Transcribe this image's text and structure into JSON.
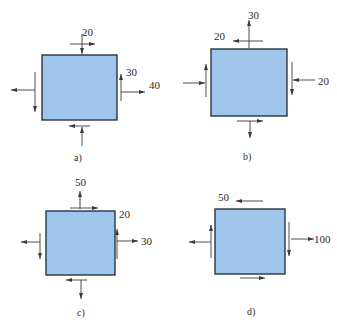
{
  "figure": {
    "fill_color": "#9fc6ea",
    "border_color": "#2b3440",
    "arrow_color": "#3a3a3a",
    "panels": [
      {
        "id": "a",
        "caption": "a)",
        "labels": [
          "20",
          "30",
          "40"
        ],
        "stresses": {
          "top": {
            "normal": "compressive",
            "shear": "right",
            "value_label": "20"
          },
          "right": {
            "normal": "tensile",
            "shear": "up",
            "normal_value": "40",
            "shear_value": "30"
          },
          "bottom": {
            "normal": "compressive",
            "shear": "left"
          },
          "left": {
            "normal": "tensile",
            "shear": "down"
          }
        }
      },
      {
        "id": "b",
        "caption": "b)",
        "labels": [
          "30",
          "20",
          "20"
        ],
        "stresses": {
          "top": {
            "normal": "tensile",
            "shear": "left",
            "normal_value": "30",
            "shear_value": "20"
          },
          "right": {
            "normal": "compressive",
            "shear": "down",
            "normal_value": "20"
          },
          "bottom": {
            "normal": "tensile",
            "shear": "right"
          },
          "left": {
            "normal": "compressive",
            "shear": "up"
          }
        }
      },
      {
        "id": "c",
        "caption": "c)",
        "labels": [
          "50",
          "20",
          "30"
        ],
        "stresses": {
          "top": {
            "normal": "tensile",
            "shear": "right",
            "normal_value": "50",
            "shear_value": "20"
          },
          "right": {
            "normal": "tensile",
            "shear": "up",
            "normal_value": "30"
          },
          "bottom": {
            "normal": "tensile",
            "shear": "left"
          },
          "left": {
            "normal": "tensile",
            "shear": "down"
          }
        }
      },
      {
        "id": "d",
        "caption": "d)",
        "labels": [
          "50",
          "100"
        ],
        "stresses": {
          "top": {
            "shear": "left",
            "shear_value": "50"
          },
          "right": {
            "normal": "tensile",
            "shear": "down",
            "normal_value": "100"
          },
          "bottom": {
            "shear": "right"
          },
          "left": {
            "normal": "tensile",
            "shear": "up"
          }
        }
      }
    ]
  }
}
